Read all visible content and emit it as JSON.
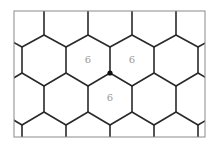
{
  "diagram": {
    "type": "hexagonal-tiling",
    "colors": {
      "edge": "#2a2a2a",
      "frame": "#8a8a8a",
      "label": "#9a9a9a",
      "vertex": "#111111",
      "background": "#ffffff"
    },
    "highlighted_vertex": {
      "x": 110,
      "y": 73
    },
    "labels": [
      {
        "id": "hex-upper-left",
        "text": "6",
        "x": 88,
        "y": 60
      },
      {
        "id": "hex-upper-right",
        "text": "6",
        "x": 132,
        "y": 60
      },
      {
        "id": "hex-lower",
        "text": "6",
        "x": 110,
        "y": 98
      }
    ]
  }
}
